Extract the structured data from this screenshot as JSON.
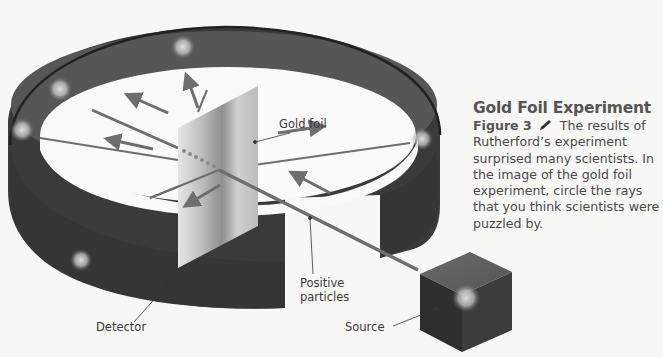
{
  "caption": {
    "title": "Gold Foil Experiment",
    "figure_label": "Figure 3",
    "body": "The results of Rutherford’s experiment surprised many scientists. In the image of the gold foil experiment, circle the rays that you think scientists were puzzled by.",
    "icon": "pencil-icon"
  },
  "labels": {
    "gold_foil": "Gold foil",
    "positive_particles_line1": "Positive",
    "positive_particles_line2": "particles",
    "detector": "Detector",
    "source": "Source"
  },
  "colors": {
    "background": "#f7f7f6",
    "detector_band": "#3a3a3a",
    "detector_inner": "#565656",
    "ray": "#6e6e6e",
    "foil_light": "#e2e2e2",
    "foil_dark": "#8a8a8a",
    "text": "#4a4a4a"
  }
}
